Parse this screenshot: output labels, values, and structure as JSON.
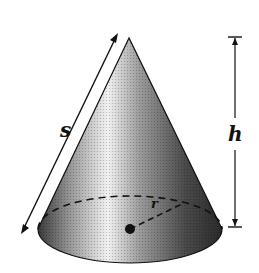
{
  "diagram": {
    "type": "cone",
    "labels": {
      "slant_height": "s",
      "height": "h",
      "radius": "r"
    },
    "colors": {
      "stroke": "#111111",
      "shade_dark": "#2a2a2a",
      "shade_light": "#f5f5f5",
      "background": "#ffffff"
    }
  }
}
